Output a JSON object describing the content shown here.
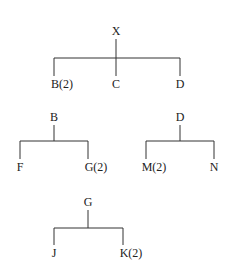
{
  "diagram": {
    "type": "tree-decomposition",
    "colors": {
      "line": "#333333",
      "text": "#222222",
      "background": "#ffffff"
    },
    "trees": [
      {
        "root": {
          "label": "X",
          "x": 116,
          "y": 35
        },
        "bar_y": 58,
        "children": [
          {
            "label": "B(2)",
            "x": 54,
            "y": 88
          },
          {
            "label": "C",
            "x": 116,
            "y": 88
          },
          {
            "label": "D",
            "x": 180,
            "y": 88
          }
        ]
      },
      {
        "root": {
          "label": "B",
          "x": 54,
          "y": 121
        },
        "bar_y": 141,
        "children": [
          {
            "label": "F",
            "x": 20,
            "y": 171
          },
          {
            "label": "G(2)",
            "x": 88,
            "y": 171
          }
        ]
      },
      {
        "root": {
          "label": "D",
          "x": 180,
          "y": 121
        },
        "bar_y": 141,
        "children": [
          {
            "label": "M(2)",
            "x": 146,
            "y": 171
          },
          {
            "label": "N",
            "x": 214,
            "y": 171
          }
        ]
      },
      {
        "root": {
          "label": "G",
          "x": 88,
          "y": 206
        },
        "bar_y": 228,
        "children": [
          {
            "label": "J",
            "x": 54,
            "y": 257
          },
          {
            "label": "K(2)",
            "x": 123,
            "y": 257
          }
        ]
      }
    ]
  }
}
